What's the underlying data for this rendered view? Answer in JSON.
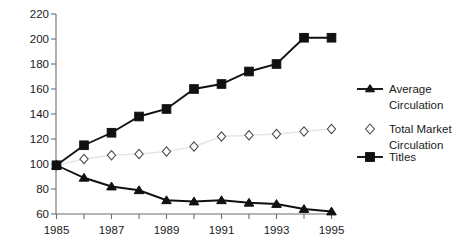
{
  "chart_data": {
    "type": "line",
    "title": "",
    "subtitle": "",
    "xlabel": "",
    "ylabel": "",
    "x": [
      1985,
      1986,
      1987,
      1988,
      1989,
      1990,
      1991,
      1992,
      1993,
      1994,
      1995
    ],
    "xtick_labels": [
      "1985",
      "",
      "1987",
      "",
      "1989",
      "",
      "1991",
      "",
      "1993",
      "",
      "1995"
    ],
    "xtick_labels_shown": [
      "1985",
      "1987",
      "1989",
      "1991",
      "1993",
      "1995"
    ],
    "ytick_labels": [
      "60",
      "80",
      "100",
      "120",
      "140",
      "160",
      "180",
      "200",
      "220"
    ],
    "yticks": [
      60,
      80,
      100,
      120,
      140,
      160,
      180,
      200,
      220
    ],
    "ylim": [
      60,
      220
    ],
    "xlim": [
      1985,
      1995
    ],
    "grid": false,
    "legend_position": "right",
    "series": [
      {
        "name": "Average Circulation",
        "legend_label_line1": "Average",
        "legend_label_line2": "Circulation",
        "marker": "triangle",
        "marker_color": "#111111",
        "line_color": "#111111",
        "values": [
          99,
          89,
          82,
          79,
          71,
          70,
          71,
          69,
          68,
          64,
          62
        ]
      },
      {
        "name": "Total Market Circulation",
        "legend_label_line1": "Total Market",
        "legend_label_line2": "Circulation",
        "marker": "open-diamond",
        "marker_color": "#ffffff",
        "line_color": "#e6e6e6",
        "values": [
          99,
          104,
          107,
          108,
          110,
          114,
          122,
          123,
          124,
          126,
          128
        ]
      },
      {
        "name": "Titles",
        "legend_label_line1": "Titles",
        "legend_label_line2": "",
        "marker": "square",
        "marker_color": "#111111",
        "line_color": "#111111",
        "values": [
          99,
          115,
          125,
          138,
          144,
          160,
          164,
          174,
          180,
          201,
          201
        ]
      }
    ]
  },
  "axis": {
    "y_labels": [
      "220",
      "200",
      "180",
      "160",
      "140",
      "120",
      "100",
      "80",
      "60"
    ],
    "x_labels": [
      "1985",
      "1987",
      "1989",
      "1991",
      "1993",
      "1995"
    ]
  },
  "legend": {
    "entries": [
      {
        "line1": "Average",
        "line2": "Circulation",
        "marker": "triangle"
      },
      {
        "line1": "Total Market",
        "line2": "Circulation",
        "marker": "open-diamond"
      },
      {
        "line1": "Titles",
        "line2": "",
        "marker": "square"
      }
    ]
  },
  "colors": {
    "ink": "#111111",
    "axis": "#6e6e6e",
    "light_line": "#e6e6e6",
    "background": "#ffffff"
  }
}
